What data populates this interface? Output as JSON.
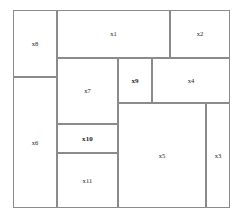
{
  "diagram": {
    "background_color": "#ffffff",
    "line_color": "#8b8b8b",
    "label_color": "#1a1a1a",
    "container": {
      "name": "outer-frame",
      "x": 13,
      "y": 10,
      "width": 217,
      "height": 198
    },
    "rectangles": [
      {
        "label": "x1",
        "x": 57,
        "y": 10,
        "width": 113,
        "height": 48,
        "bold": false
      },
      {
        "label": "x2",
        "x": 170,
        "y": 10,
        "width": 60,
        "height": 48,
        "bold": false
      },
      {
        "label": "x8",
        "x": 13,
        "y": 10,
        "width": 44,
        "height": 67,
        "bold": false
      },
      {
        "label": "x7",
        "x": 57,
        "y": 58,
        "width": 61,
        "height": 66,
        "bold": false
      },
      {
        "label": "x9",
        "x": 118,
        "y": 58,
        "width": 34,
        "height": 45,
        "bold": true
      },
      {
        "label": "x4",
        "x": 152,
        "y": 58,
        "width": 78,
        "height": 45,
        "bold": false
      },
      {
        "label": "x6",
        "x": 13,
        "y": 77,
        "width": 44,
        "height": 131,
        "bold": false
      },
      {
        "label": "x10",
        "x": 57,
        "y": 124,
        "width": 61,
        "height": 29,
        "bold": true
      },
      {
        "label": "x11",
        "x": 57,
        "y": 153,
        "width": 61,
        "height": 55,
        "bold": false
      },
      {
        "label": "x5",
        "x": 118,
        "y": 103,
        "width": 88,
        "height": 105,
        "bold": false
      },
      {
        "label": "x3",
        "x": 206,
        "y": 103,
        "width": 24,
        "height": 105,
        "bold": false
      }
    ]
  }
}
